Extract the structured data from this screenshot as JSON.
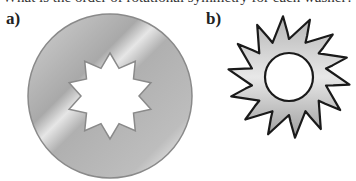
{
  "question": {
    "text": "What is the order of rotational symmetry for each washer?"
  },
  "figures": [
    {
      "label": "a)",
      "description": "Circular washer with a 10-pointed star-shaped hole",
      "hole_points": 10,
      "outer_shape": "circle",
      "fill_color": "#b8b8b8",
      "edge_color": "#8a8a8a"
    },
    {
      "label": "b)",
      "description": "Saw-blade washer with slanted teeth and a circular hole",
      "teeth": 14,
      "hole_shape": "circle",
      "fill_color": "#c0c0c0",
      "edge_color": "#1a1a1a"
    }
  ]
}
